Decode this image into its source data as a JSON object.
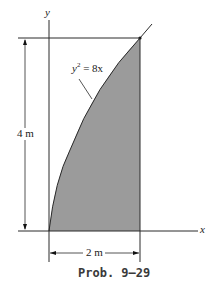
{
  "figure": {
    "axes": {
      "y_label": "y",
      "x_label": "x"
    },
    "curve": {
      "equation": "y² = 8x",
      "equation_base": "y",
      "equation_exp": "2",
      "equation_rest": " = 8x"
    },
    "dimensions": {
      "height": "4 m",
      "width": "2 m"
    },
    "caption": "Prob. 9–29",
    "colors": {
      "fill": "#9b9b9b",
      "line": "#2a2a2a",
      "caption": "#3a3a3a"
    }
  }
}
